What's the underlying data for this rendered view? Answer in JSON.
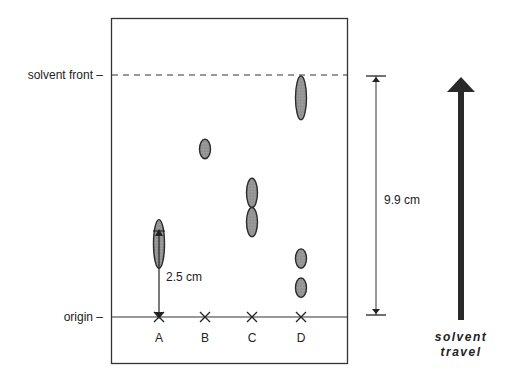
{
  "diagram": {
    "labels": {
      "solvent_front": "solvent front –",
      "origin": "origin –",
      "distance_spot_a": "2.5 cm",
      "distance_solvent": "9.9 cm",
      "solvent_travel_line1": "solvent",
      "solvent_travel_line2": "travel"
    },
    "lanes": [
      {
        "name": "A",
        "spots_cm": [
          {
            "center": 3.0,
            "length": 2.0
          }
        ]
      },
      {
        "name": "B",
        "spots_cm": [
          {
            "center": 6.9,
            "length": 0.8
          }
        ]
      },
      {
        "name": "C",
        "spots_cm": [
          {
            "center": 5.1,
            "length": 1.2
          },
          {
            "center": 3.9,
            "length": 1.2
          }
        ]
      },
      {
        "name": "D",
        "spots_cm": [
          {
            "center": 9.0,
            "length": 1.8
          },
          {
            "center": 2.4,
            "length": 0.8
          },
          {
            "center": 1.2,
            "length": 0.8
          }
        ]
      }
    ],
    "solvent_front_distance_cm": 9.9,
    "spot_a_distance_cm": 2.5,
    "colors": {
      "spot_fill": "#8a8a8a",
      "line": "#222222"
    }
  }
}
